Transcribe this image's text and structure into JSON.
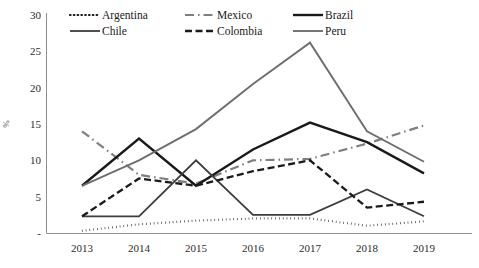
{
  "chart_data": {
    "type": "line",
    "title": "",
    "xlabel": "",
    "ylabel": "%",
    "x": [
      "2013",
      "2014",
      "2015",
      "2016",
      "2017",
      "2018",
      "2019"
    ],
    "categories": [
      "2013",
      "2014",
      "2015",
      "2016",
      "2017",
      "2018",
      "2019"
    ],
    "ylim": [
      0,
      30
    ],
    "yticks": [
      "-",
      "5",
      "10",
      "15",
      "20",
      "25",
      "30"
    ],
    "ytick_values": [
      0,
      5,
      10,
      15,
      20,
      25,
      30
    ],
    "grid": false,
    "legend_position": "top",
    "series": [
      {
        "name": "Argentina",
        "style": "dotted",
        "color": "#1a1a1a",
        "width": 2.2,
        "dash": "0.6 3.2",
        "values": [
          0.3,
          1.2,
          1.7,
          2.0,
          2.0,
          1.0,
          1.6
        ]
      },
      {
        "name": "Mexico",
        "style": "dash-dot",
        "color": "#7f7f7f",
        "width": 2.2,
        "dash": "9 4 1.5 4",
        "values": [
          14.0,
          8.0,
          6.8,
          10.0,
          10.2,
          12.3,
          14.8
        ]
      },
      {
        "name": "Brazil",
        "style": "solid",
        "color": "#1a1a1a",
        "width": 2.4,
        "dash": "",
        "values": [
          6.5,
          13.0,
          6.5,
          11.5,
          15.2,
          12.5,
          8.2
        ]
      },
      {
        "name": "Chile",
        "style": "solid",
        "color": "#3d3d3d",
        "width": 1.8,
        "dash": "",
        "values": [
          2.3,
          2.3,
          10.0,
          2.5,
          2.5,
          6.0,
          2.3
        ]
      },
      {
        "name": "Colombia",
        "style": "dashed",
        "color": "#1a1a1a",
        "width": 2.3,
        "dash": "7 3.5",
        "values": [
          2.3,
          7.5,
          6.5,
          8.5,
          10.0,
          3.5,
          4.3
        ]
      },
      {
        "name": "Peru",
        "style": "solid",
        "color": "#6e6e6e",
        "width": 1.9,
        "dash": "",
        "values": [
          6.5,
          10.0,
          14.3,
          20.5,
          26.2,
          14.0,
          9.8
        ]
      }
    ]
  },
  "legend": {
    "rows": [
      [
        "Argentina",
        "Mexico",
        "Brazil"
      ],
      [
        "Chile",
        "Colombia",
        "Peru"
      ]
    ]
  },
  "axis": {
    "y_title": "%"
  }
}
